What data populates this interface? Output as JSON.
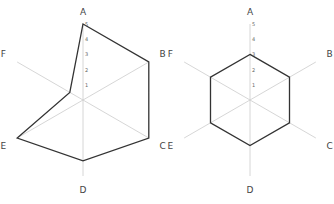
{
  "chart_data": [
    {
      "type": "radar",
      "title": "",
      "categories": [
        "A",
        "B",
        "C",
        "D",
        "E",
        "F"
      ],
      "series": [
        {
          "name": "left",
          "values": [
            5,
            5,
            5,
            4,
            5,
            1
          ]
        }
      ],
      "rlim": [
        0,
        5
      ],
      "ticks": [
        "1",
        "2",
        "3",
        "4",
        "5"
      ],
      "grid": true,
      "line_color": "#333333",
      "axis_color": "#cccccc"
    },
    {
      "type": "radar",
      "title": "",
      "categories": [
        "A",
        "B",
        "C",
        "D",
        "E",
        "F"
      ],
      "series": [
        {
          "name": "right",
          "values": [
            3,
            3,
            3,
            3,
            3,
            3
          ]
        }
      ],
      "rlim": [
        0,
        5
      ],
      "ticks": [
        "1",
        "2",
        "3",
        "4",
        "5"
      ],
      "grid": true,
      "line_color": "#333333",
      "axis_color": "#cccccc"
    }
  ]
}
